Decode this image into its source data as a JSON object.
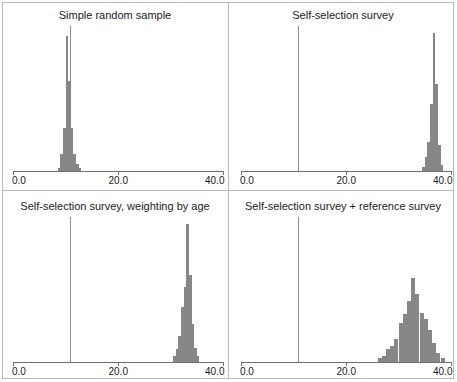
{
  "figure": {
    "width": 457,
    "height": 382,
    "background": "#ffffff",
    "frame_color": "#b9b9b9",
    "bar_color": "#878787",
    "axis_color": "#6e6e6e",
    "refline_color": "#8d8d8d",
    "layout": "2x2 grid of histogram panels"
  },
  "axis": {
    "xmin": 0.0,
    "xmax": 40.0,
    "tick_values": [
      0.0,
      20.0,
      40.0
    ],
    "tick_labels": [
      "0.0",
      "20.0",
      "40.0"
    ],
    "grid": false,
    "y_axis_shown": false
  },
  "chart_data": [
    {
      "type": "bar",
      "panel_index": 0,
      "title": "Simple random sample",
      "xlabel": "",
      "ylabel": "",
      "xlim": [
        0.0,
        40.0
      ],
      "ylim": [
        0,
        1.0
      ],
      "grid": false,
      "legend": "none",
      "reference_line_x": 10.8,
      "bin_width": 0.5,
      "categories": [
        8.75,
        9.25,
        9.75,
        10.25,
        10.75,
        11.25,
        11.75,
        12.25,
        12.75
      ],
      "values": [
        0.02,
        0.12,
        0.3,
        0.93,
        0.62,
        0.3,
        0.12,
        0.05,
        0.02
      ]
    },
    {
      "type": "bar",
      "panel_index": 1,
      "title": "Self-selection survey",
      "xlabel": "",
      "ylabel": "",
      "xlim": [
        0.0,
        40.0
      ],
      "ylim": [
        0,
        1.0
      ],
      "grid": false,
      "legend": "none",
      "reference_line_x": 10.8,
      "bin_width": 0.5,
      "categories": [
        34.75,
        35.25,
        35.75,
        36.25,
        36.75,
        37.25,
        37.75,
        38.25
      ],
      "values": [
        0.03,
        0.1,
        0.2,
        0.46,
        0.95,
        0.6,
        0.18,
        0.04
      ]
    },
    {
      "type": "bar",
      "panel_index": 2,
      "title": "Self-selection survey, weighting by age",
      "xlabel": "",
      "ylabel": "",
      "xlim": [
        0.0,
        40.0
      ],
      "ylim": [
        0,
        1.0
      ],
      "grid": false,
      "legend": "none",
      "reference_line_x": 10.8,
      "bin_width": 0.5,
      "categories": [
        30.75,
        31.25,
        31.75,
        32.25,
        32.75,
        33.25,
        33.75,
        34.25,
        34.75,
        35.25
      ],
      "values": [
        0.04,
        0.09,
        0.18,
        0.38,
        0.52,
        0.95,
        0.6,
        0.26,
        0.1,
        0.04
      ]
    },
    {
      "type": "bar",
      "panel_index": 3,
      "title": "Self-selection survey + reference survey",
      "xlabel": "",
      "ylabel": "",
      "xlim": [
        0.0,
        40.0
      ],
      "ylim": [
        0,
        1.0
      ],
      "grid": false,
      "legend": "none",
      "reference_line_x": 10.8,
      "bin_width": 0.8,
      "categories": [
        26.4,
        27.2,
        28.0,
        28.8,
        29.6,
        30.4,
        31.2,
        32.0,
        32.8,
        33.6,
        34.4,
        35.2,
        36.0,
        36.8,
        37.6,
        38.4
      ],
      "values": [
        0.03,
        0.04,
        0.09,
        0.11,
        0.16,
        0.27,
        0.33,
        0.42,
        0.58,
        0.47,
        0.34,
        0.3,
        0.22,
        0.13,
        0.06,
        0.03
      ]
    }
  ]
}
